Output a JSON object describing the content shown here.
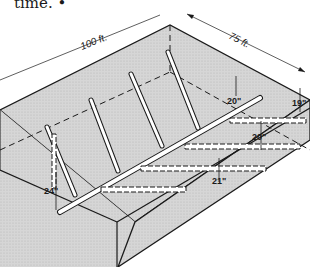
{
  "caption": {
    "text": "time. •"
  },
  "diagram": {
    "dimensions": {
      "length_label": "100 ft.",
      "width_label": "75 ft."
    },
    "depth_labels": {
      "top_right": "20\"",
      "right_edge": "19\"",
      "right_middle": "20\"",
      "middle": "21\"",
      "outlet": "24\""
    },
    "colors": {
      "fill": "#d4d4d4",
      "outline": "#1a1a1a",
      "pipe": "#ffffff"
    }
  }
}
